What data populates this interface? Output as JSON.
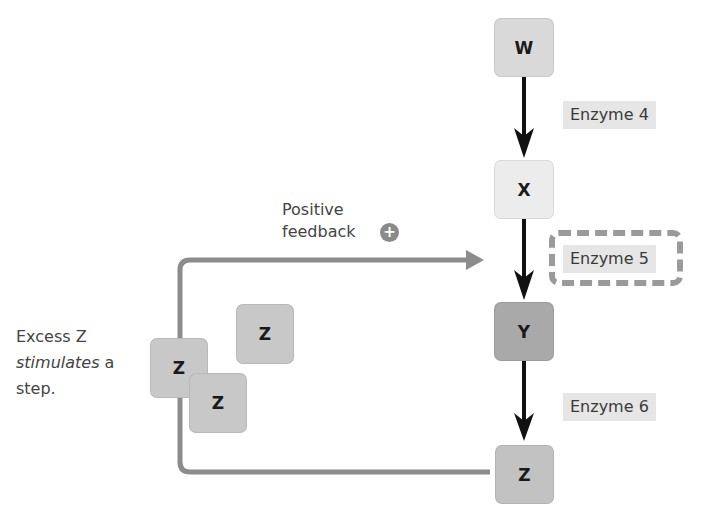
{
  "pathway": {
    "nodes": [
      {
        "id": "W",
        "label": "W",
        "color": "#d9d9d9"
      },
      {
        "id": "X",
        "label": "X",
        "color": "#ececec"
      },
      {
        "id": "Y",
        "label": "Y",
        "color": "#a9a9a9"
      },
      {
        "id": "Z",
        "label": "Z",
        "color": "#c2c2c2"
      }
    ],
    "enzymes": [
      {
        "label": "Enzyme 4",
        "highlighted": false
      },
      {
        "label": "Enzyme 5",
        "highlighted": true
      },
      {
        "label": "Enzyme 6",
        "highlighted": false
      }
    ]
  },
  "feedback": {
    "label_line1": "Positive",
    "label_line2": "feedback",
    "sign": "+",
    "arrow_color": "#8c8c8c"
  },
  "excess_z": {
    "molecules": [
      "Z",
      "Z",
      "Z"
    ],
    "caption_line1": "Excess Z",
    "caption_italic": "stimulates",
    "caption_rest": " a",
    "caption_line3": "step."
  }
}
